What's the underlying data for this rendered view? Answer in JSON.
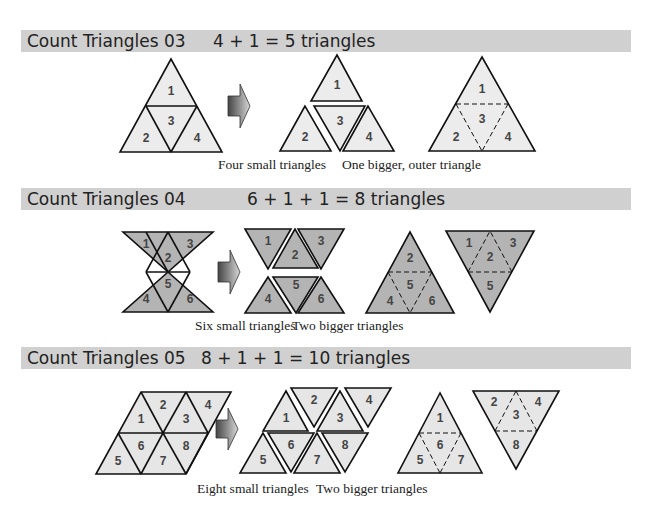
{
  "sections": [
    {
      "title": "Count Triangles 03",
      "equation": "4 + 1 = 5 triangles",
      "fill_color": "#ececec",
      "captions": [
        "Four small triangles",
        "One bigger, outer triangle"
      ],
      "labels": [
        "1",
        "2",
        "3",
        "4"
      ]
    },
    {
      "title": "Count Triangles 04",
      "equation": "6 + 1 + 1 = 8 triangles",
      "fill_color": "#b4b4b4",
      "captions": [
        "Six small triangles",
        "Two bigger triangles"
      ],
      "labels": [
        "1",
        "2",
        "3",
        "4",
        "5",
        "6"
      ]
    },
    {
      "title": "Count Triangles 05",
      "equation": "8 + 1 + 1 = 10 triangles",
      "fill_color": "#e6e6e6",
      "captions": [
        "Eight small triangles",
        "Two bigger triangles"
      ],
      "labels": [
        "1",
        "2",
        "3",
        "4",
        "5",
        "6",
        "7",
        "8"
      ]
    }
  ],
  "icons": {
    "arrow": "right-arrow-icon"
  }
}
